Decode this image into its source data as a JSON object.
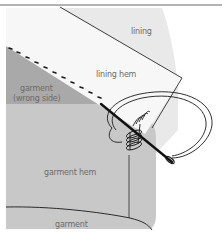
{
  "diagram": {
    "labels": {
      "lining": "lining",
      "lining_hem": "lining hem",
      "garment_wrong_side_line1": "garment",
      "garment_wrong_side_line2": "(wrong side)",
      "garment_hem": "garment hem",
      "garment": "garment"
    },
    "colors": {
      "lining_fill": "#e9e9e9",
      "lining_hem_fill": "#f7f7f7",
      "garment_wrong_side_fill": "#a9a9a9",
      "garment_hem_fill": "#c8c8c8",
      "outline": "#2a2a2a",
      "top_rule": "#9a9a9a",
      "label_text": "#6b6b6b"
    }
  }
}
